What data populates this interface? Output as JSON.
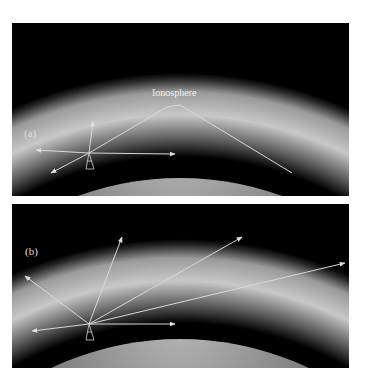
{
  "figure": {
    "panels": [
      {
        "id": "a",
        "label": "(a)",
        "layer_label": "Ionosphere"
      },
      {
        "id": "b",
        "label": "(b)"
      }
    ]
  },
  "colors": {
    "background": "#000000",
    "ionosphere_light": "#c8c8c8",
    "earth_light": "#a0a0a0",
    "ray_color": "#d8d8d8"
  }
}
